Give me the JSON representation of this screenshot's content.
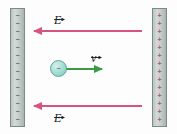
{
  "figure": {
    "width": 177,
    "height": 134,
    "background_color": "#fdfdfd"
  },
  "plates": {
    "left": {
      "name": "negative-plate",
      "charge_sign": "−",
      "charge_count": 14,
      "charge_color": "#5d6a66",
      "body_color": "#c3ccc8",
      "border_color": "#7e8a85"
    },
    "right": {
      "name": "positive-plate",
      "charge_sign": "+",
      "charge_count": 14,
      "charge_color": "#b25a72",
      "body_color": "#c3ccc8",
      "border_color": "#7e8a85"
    }
  },
  "arrows": {
    "efield_top": {
      "label": "E",
      "direction": "left",
      "color": "#d6547e"
    },
    "efield_bottom": {
      "label": "E",
      "direction": "left",
      "color": "#d6547e"
    },
    "velocity": {
      "label": "v",
      "direction": "right",
      "color": "#3a9b45"
    }
  },
  "particle": {
    "charge_sign": "−",
    "fill_color": "#a9ded5",
    "border_color": "#5fa79c"
  }
}
